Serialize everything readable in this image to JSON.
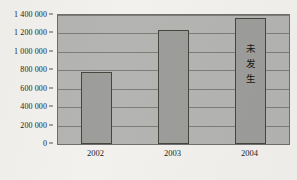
{
  "chart_data": {
    "type": "bar",
    "title": "",
    "xlabel": "",
    "ylabel": "",
    "categories": [
      "2002",
      "2003",
      "2004"
    ],
    "values": [
      780000,
      1240000,
      1370000
    ],
    "ylim": [
      0,
      1400000
    ],
    "y_ticks": [
      {
        "value": 1400000,
        "label": "1 400 000"
      },
      {
        "value": 1200000,
        "label": "1 200 000"
      },
      {
        "value": 1000000,
        "label": "1 000 000"
      },
      {
        "value": 800000,
        "label": "800 000"
      },
      {
        "value": 600000,
        "label": "600 000"
      },
      {
        "value": 400000,
        "label": "400 000"
      },
      {
        "value": 200000,
        "label": "200 000"
      },
      {
        "value": 0,
        "label": "0"
      }
    ],
    "grid": true,
    "legend": false,
    "annotations": [
      {
        "category": "2004",
        "text": "未发生",
        "characters": [
          "未",
          "发",
          "生"
        ],
        "orientation": "vertical"
      }
    ],
    "colors": {
      "bar_fill": "#9d9d9b",
      "bar_border": "#46463f",
      "plot_background": "#b4b4b2",
      "gridline": "#74746f",
      "page_background": "#f2f1ee",
      "text": "#1d1d1b"
    }
  }
}
